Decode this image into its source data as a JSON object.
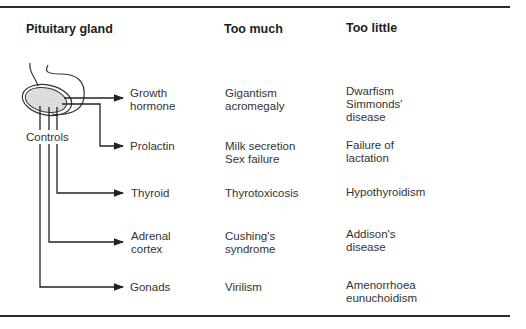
{
  "headers": {
    "gland": "Pituitary gland",
    "too_much": "Too much",
    "too_little": "Too little"
  },
  "controls_label": "Controls",
  "rows": [
    {
      "hormone": "Growth\nhormone",
      "too_much": "Gigantism\nacromegaly",
      "too_little": "Dwarfism\nSimmonds'\ndisease"
    },
    {
      "hormone": "Prolactin",
      "too_much": "Milk secretion\nSex failure",
      "too_little": "Failure of\nlactation"
    },
    {
      "hormone": "Thyroid",
      "too_much": "Thyrotoxicosis",
      "too_little": "Hypothyroidism"
    },
    {
      "hormone": "Adrenal\ncortex",
      "too_much": "Cushing's\nsyndrome",
      "too_little": "Addison's\ndisease"
    },
    {
      "hormone": "Gonads",
      "too_much": "Virilism",
      "too_little": "Amenorrhoea\neunuchoidism"
    }
  ]
}
